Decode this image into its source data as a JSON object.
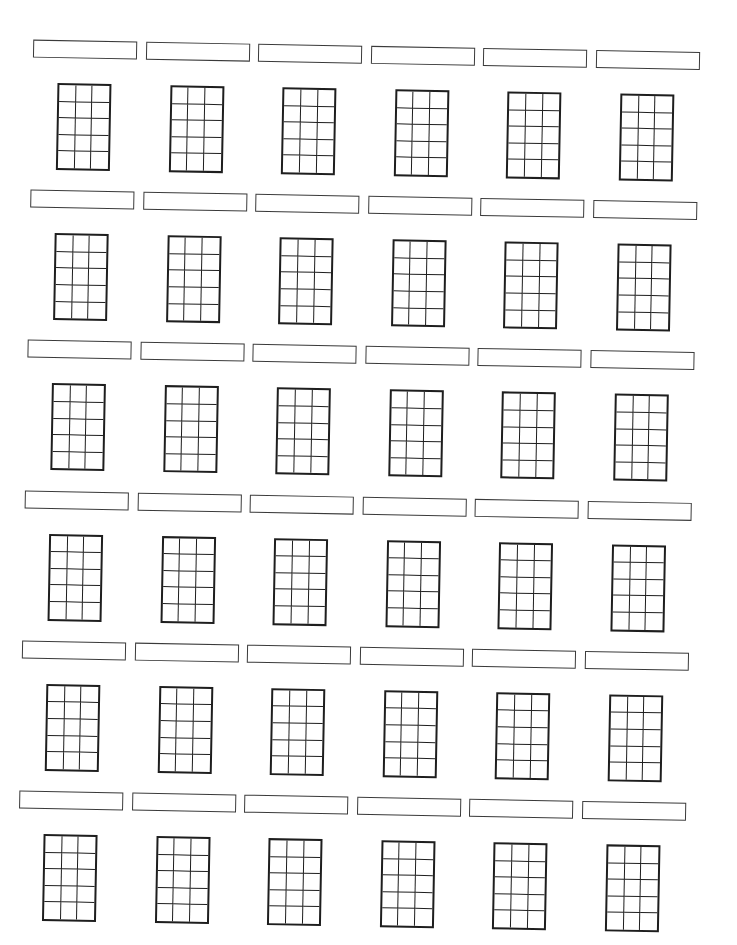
{
  "worksheet": {
    "type": "blank ukulele chord chart",
    "rows": 6,
    "columns": 6,
    "strings": 4,
    "frets": 5,
    "line_color": "#1e1e1e",
    "name_box_border_color": "#3a3a3a",
    "background": "#ffffff",
    "chords": [
      {
        "name": ""
      },
      {
        "name": ""
      },
      {
        "name": ""
      },
      {
        "name": ""
      },
      {
        "name": ""
      },
      {
        "name": ""
      },
      {
        "name": ""
      },
      {
        "name": ""
      },
      {
        "name": ""
      },
      {
        "name": ""
      },
      {
        "name": ""
      },
      {
        "name": ""
      },
      {
        "name": ""
      },
      {
        "name": ""
      },
      {
        "name": ""
      },
      {
        "name": ""
      },
      {
        "name": ""
      },
      {
        "name": ""
      },
      {
        "name": ""
      },
      {
        "name": ""
      },
      {
        "name": ""
      },
      {
        "name": ""
      },
      {
        "name": ""
      },
      {
        "name": ""
      },
      {
        "name": ""
      },
      {
        "name": ""
      },
      {
        "name": ""
      },
      {
        "name": ""
      },
      {
        "name": ""
      },
      {
        "name": ""
      },
      {
        "name": ""
      },
      {
        "name": ""
      },
      {
        "name": ""
      },
      {
        "name": ""
      },
      {
        "name": ""
      },
      {
        "name": ""
      }
    ]
  }
}
